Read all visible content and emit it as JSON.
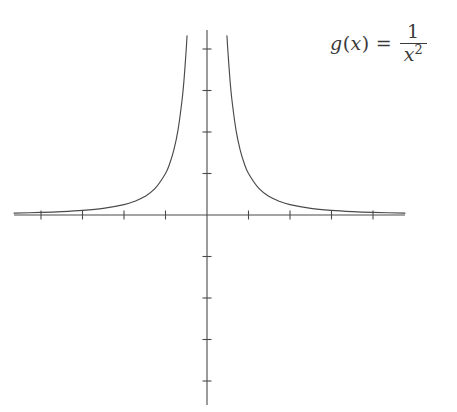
{
  "figure": {
    "background_color": "#ffffff",
    "stroke_color": "#4a4a4a",
    "label_color": "#3a3a3a"
  },
  "formula": {
    "function_name": "g",
    "open_paren": "(",
    "variable": "x",
    "close_paren": ")",
    "equals": "=",
    "numerator": "1",
    "denominator_base": "x",
    "denominator_exponent": "2",
    "plain_text": "g(x) = 1/x^2"
  },
  "chart_data": {
    "type": "line",
    "title": "",
    "subtitle": "",
    "xlabel": "",
    "ylabel": "",
    "annotations": [
      {
        "text": "g(x) = 1/x^2",
        "position": "top-right"
      }
    ],
    "legend": [],
    "legend_position": "none",
    "grid": false,
    "axes": {
      "x_axis_visible": true,
      "y_axis_visible": true,
      "origin_px": [
        207,
        215
      ],
      "unit_px": 41.5,
      "x_axis_pixel_span": [
        14,
        405
      ],
      "y_axis_pixel_span": [
        30,
        405
      ],
      "xlim": [
        -4.65,
        4.77
      ],
      "ylim": [
        -4.58,
        4.46
      ],
      "x_ticks": [
        -4,
        -3,
        -2,
        -1,
        1,
        2,
        3,
        4
      ],
      "y_ticks": [
        -4,
        -3,
        -2,
        -1,
        1,
        2,
        3,
        4
      ],
      "x_tick_labels": [
        "",
        "",
        "",
        "",
        "",
        "",
        "",
        ""
      ],
      "y_tick_labels": [
        "",
        "",
        "",
        "",
        "",
        "",
        "",
        ""
      ],
      "tick_length_px": 5
    },
    "series": [
      {
        "name": "g(x) = 1/x^2 (left branch, x < 0)",
        "expression": "1/x^2",
        "domain": [
          -4.65,
          -0.5
        ],
        "clipped_at_y": 4.32,
        "points": [
          {
            "x": -4.65,
            "y": 0.046
          },
          {
            "x": -4.0,
            "y": 0.063
          },
          {
            "x": -3.5,
            "y": 0.082
          },
          {
            "x": -3.0,
            "y": 0.111
          },
          {
            "x": -2.5,
            "y": 0.16
          },
          {
            "x": -2.0,
            "y": 0.25
          },
          {
            "x": -1.75,
            "y": 0.327
          },
          {
            "x": -1.5,
            "y": 0.444
          },
          {
            "x": -1.25,
            "y": 0.64
          },
          {
            "x": -1.0,
            "y": 1.0
          },
          {
            "x": -0.9,
            "y": 1.235
          },
          {
            "x": -0.8,
            "y": 1.563
          },
          {
            "x": -0.7,
            "y": 2.041
          },
          {
            "x": -0.6,
            "y": 2.778
          },
          {
            "x": -0.55,
            "y": 3.306
          },
          {
            "x": -0.5,
            "y": 4.0
          },
          {
            "x": -0.481,
            "y": 4.32
          }
        ]
      },
      {
        "name": "g(x) = 1/x^2 (right branch, x > 0)",
        "expression": "1/x^2",
        "domain": [
          0.5,
          4.77
        ],
        "clipped_at_y": 4.32,
        "points": [
          {
            "x": 0.481,
            "y": 4.32
          },
          {
            "x": 0.5,
            "y": 4.0
          },
          {
            "x": 0.55,
            "y": 3.306
          },
          {
            "x": 0.6,
            "y": 2.778
          },
          {
            "x": 0.7,
            "y": 2.041
          },
          {
            "x": 0.8,
            "y": 1.563
          },
          {
            "x": 0.9,
            "y": 1.235
          },
          {
            "x": 1.0,
            "y": 1.0
          },
          {
            "x": 1.25,
            "y": 0.64
          },
          {
            "x": 1.5,
            "y": 0.444
          },
          {
            "x": 1.75,
            "y": 0.327
          },
          {
            "x": 2.0,
            "y": 0.25
          },
          {
            "x": 2.5,
            "y": 0.16
          },
          {
            "x": 3.0,
            "y": 0.111
          },
          {
            "x": 3.5,
            "y": 0.082
          },
          {
            "x": 4.0,
            "y": 0.063
          },
          {
            "x": 4.77,
            "y": 0.044
          }
        ]
      }
    ],
    "asymptotes": {
      "vertical": [
        0
      ],
      "horizontal": [
        0
      ]
    }
  }
}
